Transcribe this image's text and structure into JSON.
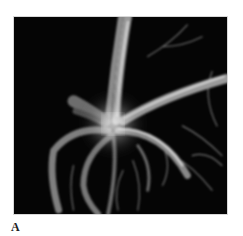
{
  "figure": {
    "panel_label": "A",
    "image_description": "Grayscale 3D vascular angiography rendering showing branching vessels radiating from a bright central junction on black background",
    "colors": {
      "background": "#050505",
      "vessel": "#bdbdbd",
      "glow": "#f2f2f2"
    }
  }
}
